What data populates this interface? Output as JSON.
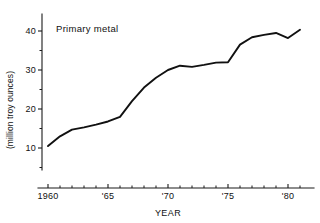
{
  "chart_data": {
    "type": "line",
    "title": "",
    "annotation": "Primary metal",
    "xlabel": "YEAR",
    "ylabel": "(million troy ounces)",
    "xlim": [
      1959,
      1981.5
    ],
    "ylim": [
      0,
      43
    ],
    "grid": false,
    "legend_position": "none",
    "x_ticks": [
      {
        "value": 1960,
        "label": "1960"
      },
      {
        "value": 1965,
        "label": "'65"
      },
      {
        "value": 1970,
        "label": "'70"
      },
      {
        "value": 1975,
        "label": "'75"
      },
      {
        "value": 1980,
        "label": "'80"
      }
    ],
    "x_minor_ticks": [
      1961,
      1962,
      1963,
      1964,
      1966,
      1967,
      1968,
      1969,
      1971,
      1972,
      1973,
      1974,
      1976,
      1977,
      1978,
      1979,
      1981
    ],
    "y_ticks": [
      {
        "value": 10,
        "label": "10"
      },
      {
        "value": 20,
        "label": "20"
      },
      {
        "value": 30,
        "label": "30"
      },
      {
        "value": 40,
        "label": "40"
      }
    ],
    "y_minor_ticks": [
      5,
      15,
      25,
      35
    ],
    "series": [
      {
        "name": "Primary metal",
        "color": "#111111",
        "x": [
          1960,
          1961,
          1962,
          1963,
          1964,
          1965,
          1966,
          1967,
          1968,
          1969,
          1970,
          1971,
          1972,
          1973,
          1974,
          1975,
          1976,
          1977,
          1978,
          1979,
          1980,
          1981
        ],
        "values": [
          10.5,
          13.0,
          14.7,
          15.3,
          16.0,
          16.8,
          18.0,
          22.0,
          25.5,
          28.0,
          30.0,
          31.1,
          30.8,
          31.3,
          31.9,
          32.0,
          36.5,
          38.4,
          39.0,
          39.5,
          38.2,
          40.3
        ]
      }
    ]
  },
  "colors": {
    "ink": "#111111",
    "background": "#ffffff"
  }
}
